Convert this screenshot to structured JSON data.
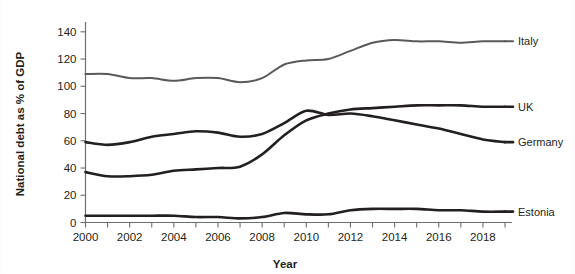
{
  "chart_data": {
    "type": "line",
    "title": "",
    "xlabel": "Year",
    "ylabel": "National debt as % of GDP",
    "xlim": [
      2000,
      2019
    ],
    "ylim": [
      0,
      145
    ],
    "yticks": [
      0,
      20,
      40,
      60,
      80,
      100,
      120,
      140
    ],
    "ytick_labels": [
      "0",
      "20",
      "40",
      "60",
      "80",
      "100",
      "120",
      "140"
    ],
    "xticks": [
      2000,
      2001,
      2002,
      2003,
      2004,
      2005,
      2006,
      2007,
      2008,
      2009,
      2010,
      2011,
      2012,
      2013,
      2014,
      2015,
      2016,
      2017,
      2018,
      2019
    ],
    "xtick_labels_shown": [
      "2000",
      "2002",
      "2004",
      "2006",
      "2008",
      "2010",
      "2012",
      "2014",
      "2016",
      "2018"
    ],
    "grid": false,
    "legend_position": "right-of-line-ends",
    "x": [
      2000,
      2001,
      2002,
      2003,
      2004,
      2005,
      2006,
      2007,
      2008,
      2009,
      2010,
      2011,
      2012,
      2013,
      2014,
      2015,
      2016,
      2017,
      2018,
      2019
    ],
    "series": [
      {
        "name": "Italy",
        "color": "#58595b",
        "width": 2.0,
        "values": [
          109,
          109,
          106,
          106,
          104,
          106,
          106,
          103,
          106,
          116,
          119,
          120,
          126,
          132,
          134,
          133,
          133,
          132,
          133,
          133
        ]
      },
      {
        "name": "UK",
        "color": "#231f20",
        "width": 2.6,
        "values": [
          37,
          34,
          34,
          35,
          38,
          39,
          40,
          41,
          50,
          64,
          75,
          80,
          83,
          84,
          85,
          86,
          86,
          86,
          85,
          85
        ]
      },
      {
        "name": "Germany",
        "color": "#231f20",
        "width": 2.6,
        "values": [
          59,
          57,
          59,
          63,
          65,
          67,
          66,
          63,
          65,
          73,
          82,
          79,
          80,
          78,
          75,
          72,
          69,
          65,
          61,
          59
        ]
      },
      {
        "name": "Estonia",
        "color": "#231f20",
        "width": 2.6,
        "values": [
          5,
          5,
          5,
          5,
          5,
          4,
          4,
          3,
          4,
          7,
          6,
          6,
          9,
          10,
          10,
          10,
          9,
          9,
          8,
          8
        ]
      }
    ]
  },
  "axes": {
    "y_title": "National debt as % of GDP",
    "x_title": "Year"
  }
}
